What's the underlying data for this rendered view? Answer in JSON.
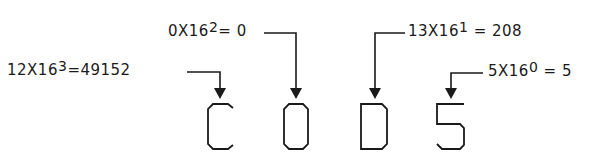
{
  "hex_number": "C0D5",
  "digits": [
    {
      "char": "C",
      "value": "12",
      "base": "16",
      "power": "3",
      "result": "49152"
    },
    {
      "char": "0",
      "value": "0",
      "base": "16",
      "power": "2",
      "result": "0"
    },
    {
      "char": "D",
      "value": "13",
      "base": "16",
      "power": "1",
      "result": "208"
    },
    {
      "char": "5",
      "value": "5",
      "base": "16",
      "power": "0",
      "result": "5"
    }
  ],
  "labels": {
    "c": {
      "pre": "12X16",
      "exp": "3",
      "post": "=49152"
    },
    "zero": {
      "pre": "0X16",
      "exp": "2",
      "post": "= 0"
    },
    "d": {
      "pre": "13X16",
      "exp": "1",
      "post": " = 208"
    },
    "five": {
      "pre": "5X16",
      "exp": "0",
      "post": " = 5"
    }
  },
  "colors": {
    "ink": "#1a1a1a",
    "background": "#ffffff"
  }
}
